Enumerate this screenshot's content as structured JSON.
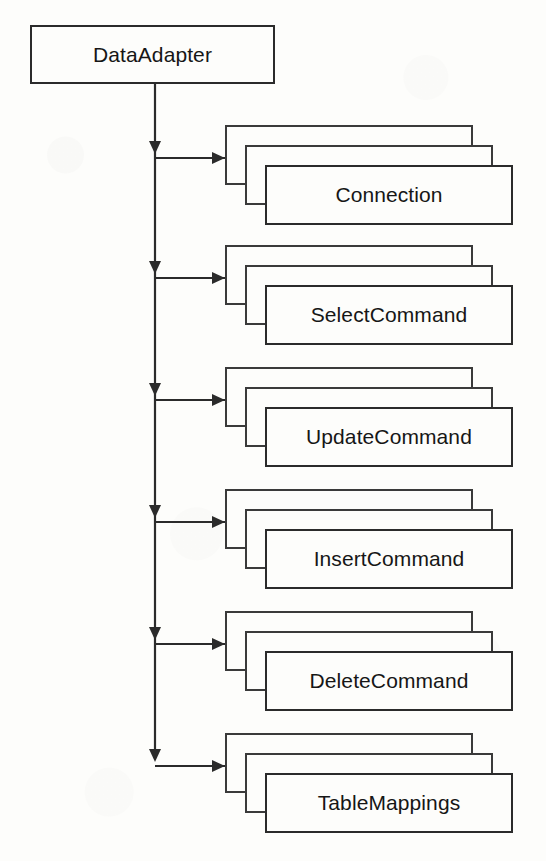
{
  "diagram": {
    "background_color": "#fdfdfb",
    "line_color": "#2b2b2b",
    "text_color": "#161616",
    "root": {
      "label": "DataAdapter",
      "x": 30,
      "y": 25,
      "width": 245,
      "height": 59
    },
    "spine": {
      "x": 155,
      "top": 84,
      "bottom": 758
    },
    "card_stack": {
      "cards_per_group": 3,
      "offset_x": 20,
      "offset_y": 20,
      "card_width": 248,
      "card_height": 60,
      "back_card_x": 225
    },
    "groups": [
      {
        "label": "Connection",
        "top": 125,
        "arrow_y": 158
      },
      {
        "label": "SelectCommand",
        "top": 245,
        "arrow_y": 278
      },
      {
        "label": "UpdateCommand",
        "top": 367,
        "arrow_y": 400
      },
      {
        "label": "InsertCommand",
        "top": 489,
        "arrow_y": 522
      },
      {
        "label": "DeleteCommand",
        "top": 611,
        "arrow_y": 644
      },
      {
        "label": "TableMappings",
        "top": 733,
        "arrow_y": 766
      }
    ]
  }
}
